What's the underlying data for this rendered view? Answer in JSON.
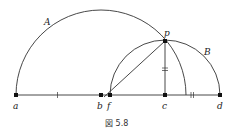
{
  "figure": {
    "caption": "図 5.8",
    "stroke_color": "#333333",
    "points": {
      "a": {
        "label": "a",
        "x": 16,
        "y": 95
      },
      "b": {
        "label": "b",
        "x": 101,
        "y": 95
      },
      "f": {
        "label": "f",
        "x": 110,
        "y": 95
      },
      "c": {
        "label": "c",
        "x": 165,
        "y": 95
      },
      "d": {
        "label": "d",
        "x": 220,
        "y": 95
      },
      "p": {
        "label": "p",
        "x": 165,
        "y": 41
      }
    },
    "arcs": {
      "A": {
        "label": "A",
        "center": "b",
        "radius": 85
      },
      "B": {
        "label": "B",
        "center": "c",
        "radius": 55
      }
    }
  }
}
